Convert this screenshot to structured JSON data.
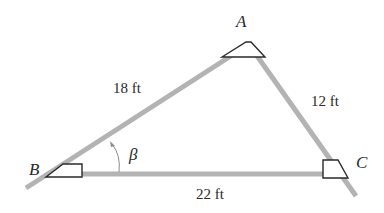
{
  "diagram": {
    "type": "triangle-survey",
    "vertices": {
      "A": {
        "label": "A"
      },
      "B": {
        "label": "B"
      },
      "C": {
        "label": "C"
      }
    },
    "sides": {
      "AB": {
        "label": "18 ft"
      },
      "AC": {
        "label": "12 ft"
      },
      "BC": {
        "label": "22 ft"
      }
    },
    "angle": {
      "vertex": "B",
      "label": "β"
    },
    "colors": {
      "line": "#b3b3b3",
      "marker_stroke": "#2a2a2a",
      "text": "#2a2a2a",
      "background": "#ffffff"
    }
  }
}
